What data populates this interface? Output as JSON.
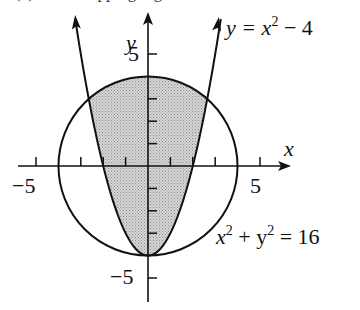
{
  "figure": {
    "top_cropped_text": "(c) ... overlapping region",
    "axes": {
      "x_label": "x",
      "y_label": "y",
      "x_tick_labels": [
        "−5",
        "5"
      ],
      "y_tick_labels": [
        "5",
        "−5"
      ],
      "x_range": [
        -5.8,
        6.4
      ],
      "y_range": [
        -6.0,
        7.3
      ]
    },
    "curves": [
      {
        "name": "parabola",
        "equation": "y = x² − 4",
        "label_parts": [
          "y = x",
          "2",
          " − 4"
        ]
      },
      {
        "name": "circle",
        "equation": "x² + y² = 16",
        "label_parts": [
          "x",
          "2",
          " + y",
          "2",
          " = 16"
        ]
      }
    ],
    "shaded_region": "inside circle and above parabola",
    "colors": {
      "ink": "#111111",
      "shade": "#c8c8c8",
      "background": "#ffffff"
    }
  }
}
